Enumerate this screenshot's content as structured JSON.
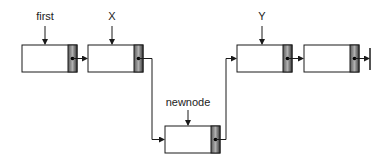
{
  "diagram": {
    "labels": {
      "first": "first",
      "x": "X",
      "y": "Y",
      "newnode": "newnode"
    },
    "nodes": [
      {
        "id": "node-first",
        "label_ref": "first"
      },
      {
        "id": "node-x",
        "label_ref": "X"
      },
      {
        "id": "node-newnode",
        "label_ref": "newnode"
      },
      {
        "id": "node-y",
        "label_ref": "Y"
      },
      {
        "id": "node-tail",
        "label_ref": ""
      }
    ],
    "links": [
      {
        "from": "node-first",
        "to": "node-x"
      },
      {
        "from": "node-x",
        "to": "node-newnode"
      },
      {
        "from": "node-newnode",
        "to": "node-y"
      },
      {
        "from": "node-y",
        "to": "node-tail"
      },
      {
        "from": "node-tail",
        "to": "null"
      }
    ],
    "colors": {
      "line": "#1a1a1a",
      "box_fill": "#ffffff",
      "pointer_dark": "#3a3a3a",
      "pointer_light": "#a8a8a8"
    }
  }
}
